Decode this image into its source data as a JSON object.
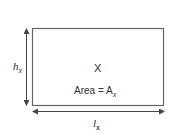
{
  "diagram": {
    "rectangle": {
      "name": "X",
      "area_label": "Area = A",
      "area_subscript": "x"
    },
    "height_label": {
      "symbol": "h",
      "subscript": "x"
    },
    "length_label": {
      "symbol": "l",
      "subscript": "x"
    },
    "colors": {
      "stroke": "#555555",
      "text": "#333333",
      "background": "#ffffff"
    }
  }
}
